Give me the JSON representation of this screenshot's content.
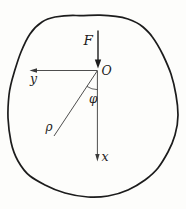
{
  "figure": {
    "labels": {
      "force": "F",
      "origin": "O",
      "y_axis": "y",
      "x_axis": "x",
      "radius": "ρ",
      "angle": "φ"
    },
    "colors": {
      "ink": "#1c1c1c",
      "axis": "#3a3a3a",
      "background": "#fdfdfb"
    }
  }
}
